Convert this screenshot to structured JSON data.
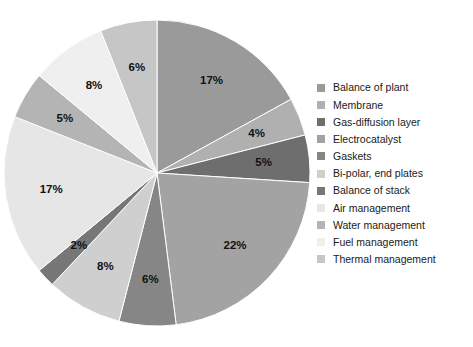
{
  "chart_data": {
    "type": "pie",
    "title": "",
    "legend_position": "right",
    "start_angle_deg": 0,
    "direction": "clockwise",
    "total": 100,
    "unit": "%",
    "categories": [
      "Balance of plant",
      "Membrane",
      "Gas-diffusion layer",
      "Electrocatalyst",
      "Gaskets",
      "Bi-polar, end plates",
      "Balance of stack",
      "Air management",
      "Water management",
      "Fuel management",
      "Thermal management"
    ],
    "values": [
      17,
      4,
      5,
      22,
      6,
      8,
      2,
      17,
      5,
      8,
      6
    ],
    "labels": [
      "17%",
      "4%",
      "5%",
      "22%",
      "6%",
      "8%",
      "2%",
      "17%",
      "5%",
      "8%",
      "6%"
    ],
    "colors": [
      "#9a9a9a",
      "#b0b0b0",
      "#6e6e6e",
      "#a3a3a3",
      "#868686",
      "#cfcfcf",
      "#777777",
      "#e6e6e6",
      "#b4b4b4",
      "#efefef",
      "#c6c6c6"
    ],
    "slices": [
      {
        "label": "Balance of plant",
        "value": 17,
        "display": "17%",
        "color": "#9a9a9a"
      },
      {
        "label": "Membrane",
        "value": 4,
        "display": "4%",
        "color": "#b0b0b0"
      },
      {
        "label": "Gas-diffusion layer",
        "value": 5,
        "display": "5%",
        "color": "#6e6e6e"
      },
      {
        "label": "Electrocatalyst",
        "value": 22,
        "display": "22%",
        "color": "#a3a3a3"
      },
      {
        "label": "Gaskets",
        "value": 6,
        "display": "6%",
        "color": "#868686"
      },
      {
        "label": "Bi-polar, end plates",
        "value": 8,
        "display": "8%",
        "color": "#cfcfcf"
      },
      {
        "label": "Balance of stack",
        "value": 2,
        "display": "2%",
        "color": "#777777"
      },
      {
        "label": "Air management",
        "value": 17,
        "display": "17%",
        "color": "#e6e6e6"
      },
      {
        "label": "Water management",
        "value": 5,
        "display": "5%",
        "color": "#b4b4b4"
      },
      {
        "label": "Fuel management",
        "value": 8,
        "display": "8%",
        "color": "#efefef"
      },
      {
        "label": "Thermal management",
        "value": 6,
        "display": "6%",
        "color": "#c6c6c6"
      }
    ]
  },
  "legend": {
    "items": [
      {
        "label": "Balance of plant",
        "color": "#9a9a9a"
      },
      {
        "label": "Membrane",
        "color": "#b0b0b0"
      },
      {
        "label": "Gas-diffusion layer",
        "color": "#6e6e6e"
      },
      {
        "label": "Electrocatalyst",
        "color": "#a3a3a3"
      },
      {
        "label": "Gaskets",
        "color": "#868686"
      },
      {
        "label": "Bi-polar, end plates",
        "color": "#cfcfcf"
      },
      {
        "label": "Balance of stack",
        "color": "#777777"
      },
      {
        "label": "Air management",
        "color": "#e6e6e6"
      },
      {
        "label": "Water management",
        "color": "#b4b4b4"
      },
      {
        "label": "Fuel management",
        "color": "#efefef"
      },
      {
        "label": "Thermal management",
        "color": "#c6c6c6"
      }
    ]
  },
  "geometry": {
    "center_x": 157,
    "center_y": 173,
    "radius": 153,
    "label_radius_ratio": 0.7
  }
}
